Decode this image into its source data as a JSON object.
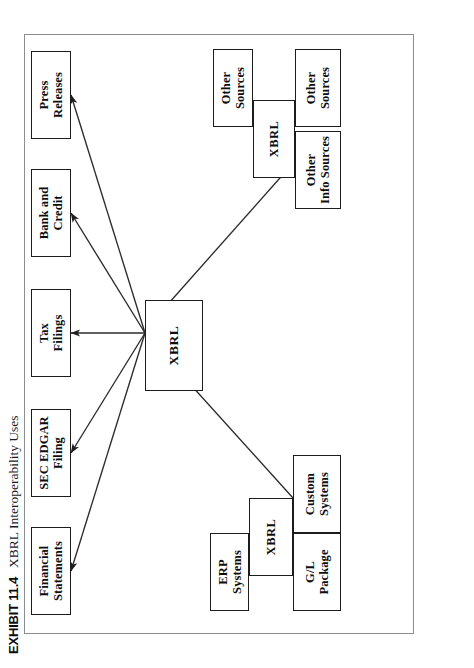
{
  "figure": {
    "exhibit_label": "EXHIBIT 11.4",
    "title": "XBRL Interoperability Uses"
  },
  "diagram": {
    "type": "flow-diagram",
    "orientation": "rotated-90-ccw-on-page",
    "hub": {
      "id": "hub",
      "label": "XBRL"
    },
    "outputs": [
      {
        "id": "out-financial-statements",
        "label": "Financial\nStatements"
      },
      {
        "id": "out-sec-edgar-filing",
        "label": "SEC EDGAR\nFiling"
      },
      {
        "id": "out-tax-filings",
        "label": "Tax\nFilings"
      },
      {
        "id": "out-bank-and-credit",
        "label": "Bank and\nCredit"
      },
      {
        "id": "out-press-releases",
        "label": "Press\nReleases"
      }
    ],
    "source_clusters": [
      {
        "id": "cluster-left",
        "hub": {
          "id": "left-xbrl",
          "label": "XBRL"
        },
        "members": [
          {
            "id": "src-erp-systems",
            "label": "ERP\nSystems"
          },
          {
            "id": "src-gl-package",
            "label": "G/L\nPackage"
          },
          {
            "id": "src-custom-systems",
            "label": "Custom\nSystems"
          }
        ]
      },
      {
        "id": "cluster-right",
        "hub": {
          "id": "right-xbrl",
          "label": "XBRL"
        },
        "members": [
          {
            "id": "src-other-sources-top",
            "label": "Other\nSources"
          },
          {
            "id": "src-other-info-sources",
            "label": "Other\nInfo Sources"
          },
          {
            "id": "src-other-sources-bottom",
            "label": "Other\nSources"
          }
        ]
      }
    ],
    "edges": [
      {
        "from": "hub",
        "to": "out-financial-statements",
        "arrow": true
      },
      {
        "from": "hub",
        "to": "out-sec-edgar-filing",
        "arrow": true
      },
      {
        "from": "hub",
        "to": "out-tax-filings",
        "arrow": true
      },
      {
        "from": "hub",
        "to": "out-bank-and-credit",
        "arrow": true
      },
      {
        "from": "hub",
        "to": "out-press-releases",
        "arrow": true
      },
      {
        "from": "left-xbrl",
        "to": "hub",
        "arrow": true
      },
      {
        "from": "right-xbrl",
        "to": "hub",
        "arrow": true
      }
    ],
    "colors": {
      "box_border": "#1c1c1c",
      "frame_border": "#8d8d8d",
      "line": "#2b2b2b",
      "background": "#ffffff",
      "text": "#0d0d0d"
    }
  }
}
